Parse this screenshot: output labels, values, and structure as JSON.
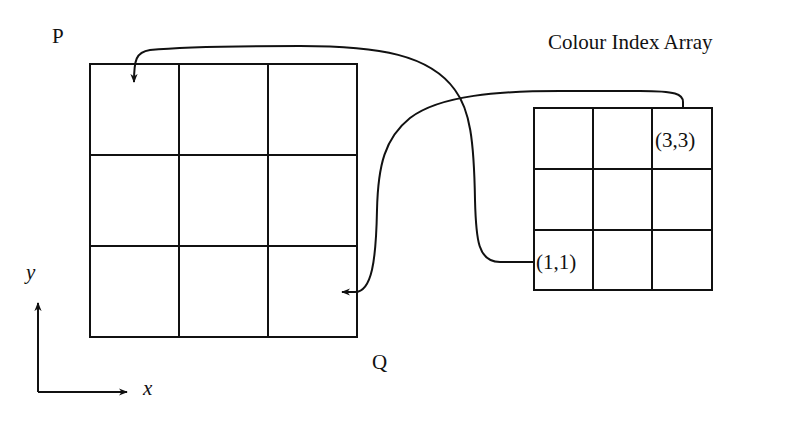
{
  "diagram": {
    "corner_label_top_left": "P",
    "corner_label_bottom_right": "Q",
    "array_title": "Colour Index Array",
    "axes": {
      "x_label": "x",
      "y_label": "y"
    },
    "source_grid": {
      "rows": 3,
      "cols": 3,
      "cell_labels": {
        "top_right": "(3,3)",
        "bottom_left": "(1,1)"
      }
    },
    "target_grid": {
      "rows": 3,
      "cols": 3
    },
    "mappings": [
      {
        "from": "(1,1)",
        "to": "P"
      },
      {
        "from": "(3,3)",
        "to": "Q"
      }
    ],
    "colors": {
      "line": "#111111",
      "background": "#ffffff"
    }
  }
}
